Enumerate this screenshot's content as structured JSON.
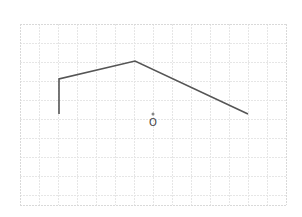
{
  "canvas": {
    "width": 302,
    "height": 217,
    "background": "#ffffff"
  },
  "grid": {
    "x0": 20,
    "y0": 24,
    "x1": 286,
    "y1": 205,
    "cell": 19,
    "color": "#e6e6e6",
    "border_color": "#d9d9d9",
    "dashed": true
  },
  "polyline": {
    "points": [
      [
        59,
        114
      ],
      [
        59,
        79
      ],
      [
        135,
        61
      ],
      [
        248,
        114
      ]
    ],
    "stroke": "#555555",
    "width": 1.6
  },
  "point": {
    "x": 153,
    "y": 114,
    "r": 1.5,
    "fill": "#888888"
  },
  "label": {
    "text": "O",
    "x": 153,
    "y": 126,
    "color": "#444444"
  }
}
